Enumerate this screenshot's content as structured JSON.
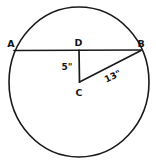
{
  "diagram": {
    "shape": "circle",
    "stroke_color": "#1a1a1a",
    "background_color": "#ffffff",
    "circle": {
      "center_label": "C",
      "cx": 79,
      "cy": 82,
      "rx": 70,
      "ry": 75
    },
    "points": [
      {
        "id": "A",
        "label": "A",
        "x": 15,
        "y": 50,
        "label_x": 11,
        "label_y": 46
      },
      {
        "id": "B",
        "label": "B",
        "x": 141,
        "y": 50,
        "label_x": 141,
        "label_y": 46
      },
      {
        "id": "D",
        "label": "D",
        "x": 79,
        "y": 50,
        "label_x": 79,
        "label_y": 44
      },
      {
        "id": "C",
        "label": "C",
        "x": 79,
        "y": 82,
        "label_x": 79,
        "label_y": 95
      }
    ],
    "segments": [
      {
        "id": "chord-AB",
        "from": "A",
        "to": "B",
        "label": ""
      },
      {
        "id": "segment-DC",
        "from": "D",
        "to": "C",
        "label": "5\""
      },
      {
        "id": "segment-CB",
        "from": "C",
        "to": "B",
        "label": "13\""
      }
    ],
    "measures": [
      {
        "id": "measure-dc",
        "text": "5\"",
        "x": 67,
        "y": 67,
        "rotation": 0
      },
      {
        "id": "measure-cb",
        "text": "13\"",
        "x": 114,
        "y": 77,
        "rotation": -26
      }
    ]
  }
}
